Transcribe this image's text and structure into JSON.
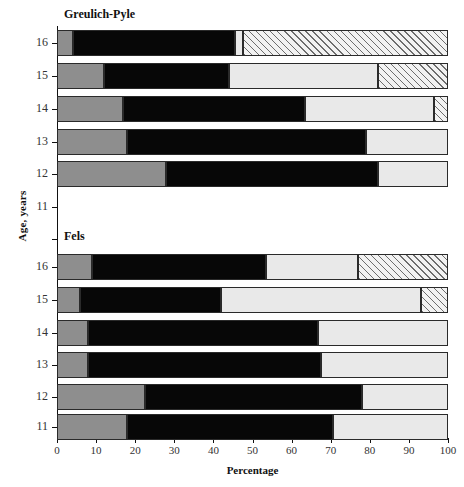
{
  "chart_data": {
    "type": "bar",
    "orientation": "horizontal",
    "stacked": true,
    "title": "",
    "xlabel": "Percentage",
    "ylabel": "Age, years",
    "xlim": [
      0,
      100
    ],
    "xticks": [
      0,
      10,
      20,
      30,
      40,
      50,
      60,
      70,
      80,
      90,
      100
    ],
    "grid": false,
    "legend": "none",
    "series_names": [
      "segment-1-dark-gray",
      "segment-2-black",
      "segment-3-light-gray",
      "segment-4-hatched"
    ],
    "series_colors": [
      "#8e8e8e",
      "#070707",
      "#e9e9e9",
      "hatched"
    ],
    "panels": [
      {
        "name": "Greulich-Pyle",
        "categories": [
          "16",
          "15",
          "14",
          "13",
          "12"
        ],
        "rows": [
          {
            "age": "16",
            "values": [
              4.0,
              41.5,
              2.0,
              52.5
            ]
          },
          {
            "age": "15",
            "values": [
              12.0,
              32.0,
              38.0,
              18.0
            ]
          },
          {
            "age": "14",
            "values": [
              17.0,
              46.5,
              33.0,
              3.5
            ]
          },
          {
            "age": "13",
            "values": [
              18.0,
              61.0,
              21.0,
              0.0
            ]
          },
          {
            "age": "12",
            "values": [
              28.0,
              54.0,
              18.0,
              0.0
            ]
          }
        ]
      },
      {
        "name": "Fels",
        "categories": [
          "16",
          "15",
          "14",
          "13",
          "12",
          "11"
        ],
        "rows": [
          {
            "age": "16",
            "values": [
              9.0,
              44.5,
              23.5,
              23.0
            ]
          },
          {
            "age": "15",
            "values": [
              6.0,
              36.0,
              51.0,
              7.0
            ]
          },
          {
            "age": "14",
            "values": [
              8.0,
              58.7,
              33.3,
              0.0
            ]
          },
          {
            "age": "13",
            "values": [
              8.0,
              59.5,
              32.5,
              0.0
            ]
          },
          {
            "age": "12",
            "values": [
              22.5,
              55.5,
              22.0,
              0.0
            ]
          },
          {
            "age": "11",
            "values": [
              18.0,
              52.5,
              29.5,
              0.0
            ]
          }
        ]
      }
    ],
    "y_axis_ticks": [
      "16",
      "15",
      "14",
      "13",
      "12",
      "11",
      "16",
      "15",
      "14",
      "13",
      "12",
      "11"
    ]
  },
  "axes": {
    "x_title": "Percentage",
    "y_title": "Age, years",
    "x_ticklabels": [
      "0",
      "10",
      "20",
      "30",
      "40",
      "50",
      "60",
      "70",
      "80",
      "90",
      "100"
    ]
  },
  "panel_titles": {
    "top": "Greulich-Pyle",
    "bottom": "Fels"
  }
}
